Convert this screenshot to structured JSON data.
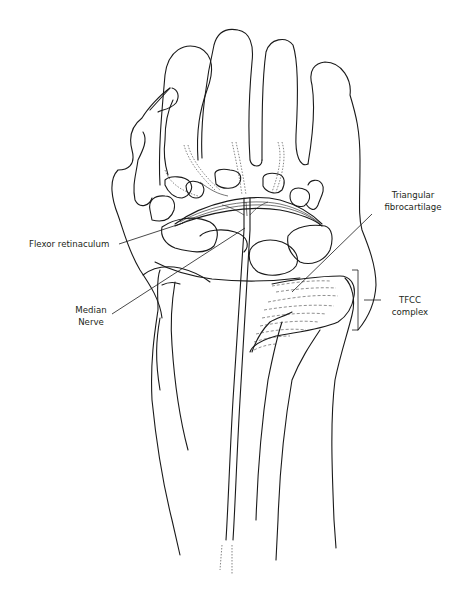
{
  "figure": {
    "labels": {
      "flexor_retinaculum": "Flexor retinaculum",
      "median_nerve_line1": "Median",
      "median_nerve_line2": "Nerve",
      "triangular_line1": "Triangular",
      "triangular_line2": "fibrocartilage",
      "tfcc_line1": "TFCC",
      "tfcc_line2": "complex"
    },
    "colors": {
      "ink": "#1a1a1a",
      "background": "#ffffff"
    }
  }
}
